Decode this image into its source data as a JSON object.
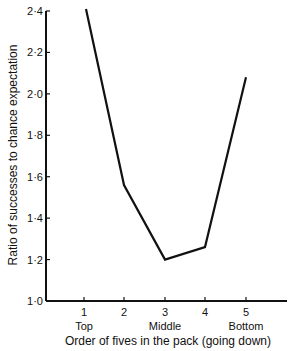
{
  "chart_data": {
    "type": "line",
    "title": "",
    "xlabel": "Order of fives in the pack (going down)",
    "ylabel": "Ratio of successes to chance expectation",
    "x": [
      1,
      2,
      3,
      4,
      5
    ],
    "x_tick_labels": [
      "1",
      "2",
      "3",
      "4",
      "5"
    ],
    "x_sub_labels": [
      {
        "x": 1,
        "label": "Top"
      },
      {
        "x": 3,
        "label": "Middle"
      },
      {
        "x": 5,
        "label": "Bottom"
      }
    ],
    "series": [
      {
        "name": "ratio",
        "values": [
          2.41,
          1.56,
          1.2,
          1.26,
          2.08
        ]
      }
    ],
    "y_ticks": [
      "1·0",
      "1·2",
      "1·4",
      "1·6",
      "1·8",
      "2·0",
      "2·2",
      "2·4"
    ],
    "ylim": [
      1.0,
      2.4
    ],
    "xlim": [
      0,
      6
    ],
    "grid": false,
    "legend": null
  }
}
